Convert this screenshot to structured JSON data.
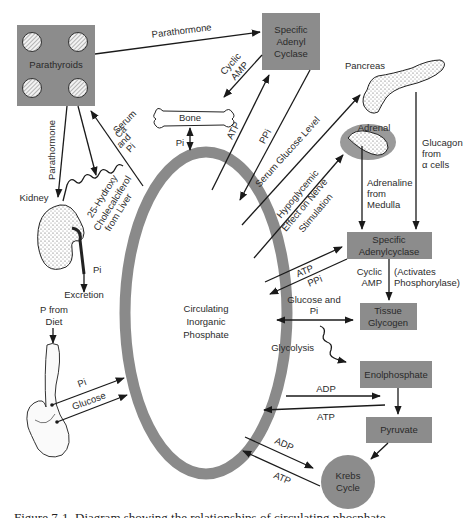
{
  "diagram": {
    "center": {
      "lines": [
        "Circulating",
        "Inorganic",
        "Phosphate"
      ]
    },
    "colors": {
      "box_fill": "#8c8c8c",
      "ring": "#8a8a8a",
      "line": "#1a1a1a",
      "background": "#ffffff"
    },
    "nodes": {
      "parathyroids": "Parathyroids",
      "specific_adenyl_cyclase": [
        "Specific",
        "Adenyl",
        "Cyclase"
      ],
      "bone": "Bone",
      "kidney": "Kidney",
      "excretion": "Excretion",
      "p_from_diet": [
        "P from",
        "Diet"
      ],
      "pancreas": "Pancreas",
      "adrenal": "Adrenal",
      "specific_adenylcyclase": [
        "Specific",
        "Adenylcyclase"
      ],
      "tissue_glycogen": [
        "Tissue",
        "Glycogen"
      ],
      "enolphosphate": "Enolphosphate",
      "pyruvate": "Pyruvate",
      "krebs_cycle": [
        "Krebs",
        "Cycle"
      ]
    },
    "edges": {
      "parathormone_top": "Parathormone",
      "parathormone_kidney": "Parathormone",
      "cyclic_amp_bone": [
        "Cyclic",
        "AMP"
      ],
      "serum_ca_pi": [
        "Serum",
        "Ca",
        "and",
        "Pi"
      ],
      "bone_pi": "Pi",
      "atp_top": "ATP",
      "ppi_top": "PPi",
      "serum_glucose_level": "Serum Glucose Level",
      "hypoglycemic": [
        "Hypoglycemic",
        "Effect on Nerve",
        "Stimulation"
      ],
      "hydroxy": [
        "25-Hydroxy",
        "Cholecalciferol",
        "from Liver"
      ],
      "kidney_pi": "Pi",
      "glucagon": [
        "Glucagon",
        "from",
        "α cells"
      ],
      "adrenaline": [
        "Adrenaline",
        "from",
        "Medulla"
      ],
      "atp_adenylcyclase": "ATP",
      "ppi_adenylcyclase": "PPi",
      "cyclic_amp": [
        "Cyclic",
        "AMP"
      ],
      "activates": [
        "(Activates",
        "Phosphorylase)"
      ],
      "glucose_and_pi": [
        "Glucose and",
        "Pi"
      ],
      "glycolysis": "Glycolysis",
      "adp_enol": "ADP",
      "atp_enol": "ATP",
      "adp_krebs": "ADP",
      "atp_krebs": "ATP",
      "gut_pi": "Pi",
      "gut_glucose": "Glucose"
    }
  },
  "caption": "Figure 7-1. Diagram showing the relationships of circulating phosphate"
}
